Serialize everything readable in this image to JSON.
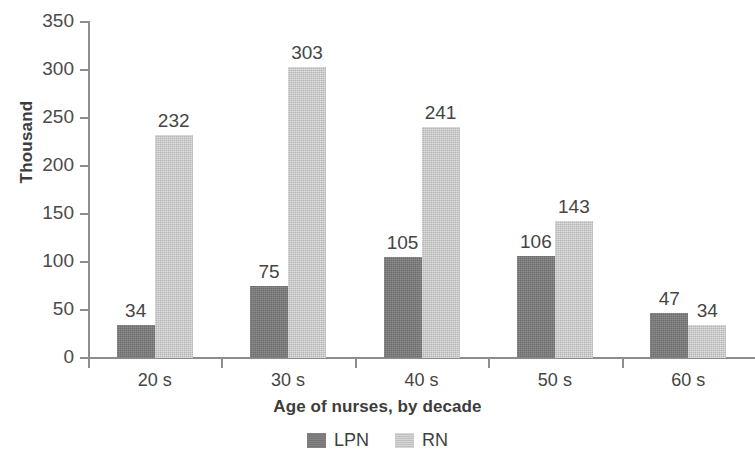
{
  "chart_data": {
    "type": "bar",
    "title": "",
    "xlabel": "Age of nurses, by decade",
    "ylabel": "Thousand",
    "categories": [
      "20 s",
      "30 s",
      "40 s",
      "50 s",
      "60 s"
    ],
    "series": [
      {
        "name": "LPN",
        "color": "#7b7b7b",
        "values": [
          34,
          75,
          105,
          106,
          47
        ]
      },
      {
        "name": "RN",
        "color": "#cacaca",
        "values": [
          232,
          303,
          241,
          143,
          34
        ]
      }
    ],
    "ylim": [
      0,
      350
    ],
    "ytick_labels": [
      "0",
      "50",
      "100",
      "150",
      "200",
      "250",
      "300",
      "350"
    ],
    "ytick_values": [
      0,
      50,
      100,
      150,
      200,
      250,
      300,
      350
    ],
    "grid": false,
    "legend_position": "bottom",
    "data_labels": {
      "LPN": [
        "34",
        "75",
        "105",
        "106",
        "47"
      ],
      "RN": [
        "232",
        "303",
        "241",
        "143",
        "34"
      ]
    }
  },
  "legend": {
    "items": [
      {
        "label": "LPN"
      },
      {
        "label": "RN"
      }
    ]
  }
}
